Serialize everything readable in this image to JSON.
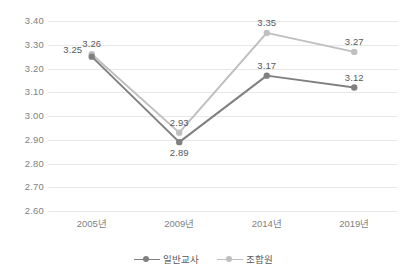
{
  "chart_data": {
    "type": "line",
    "title": "",
    "xlabel": "",
    "ylabel": "",
    "ylim": [
      2.6,
      3.4
    ],
    "ytick_step": 0.1,
    "grid": true,
    "legend_position": "bottom-center",
    "categories": [
      "2005년",
      "2009년",
      "2014년",
      "2019년"
    ],
    "ytick_labels": [
      "3.40",
      "3.30",
      "3.20",
      "3.10",
      "3.00",
      "2.90",
      "2.80",
      "2.70",
      "2.60"
    ],
    "ytick_values": [
      3.4,
      3.3,
      3.2,
      3.1,
      3.0,
      2.9,
      2.8,
      2.7,
      2.6
    ],
    "series": [
      {
        "name": "일반교사",
        "color": "#808080",
        "values": [
          3.25,
          2.89,
          3.17,
          3.12
        ],
        "labels": [
          "3.25",
          "2.89",
          "3.17",
          "3.12"
        ],
        "label_positions": [
          "left",
          "below",
          "above",
          "above"
        ]
      },
      {
        "name": "조합원",
        "color": "#bfbfbf",
        "values": [
          3.26,
          2.93,
          3.35,
          3.27
        ],
        "labels": [
          "3.26",
          "2.93",
          "3.35",
          "3.27"
        ],
        "label_positions": [
          "above",
          "above",
          "above",
          "above"
        ]
      }
    ]
  },
  "legend": {
    "items": [
      {
        "label": "일반교사",
        "color": "#808080"
      },
      {
        "label": "조합원",
        "color": "#bfbfbf"
      }
    ]
  },
  "colors": {
    "background": "#ffffff",
    "gridline": "#e8e8e8",
    "tick_text": "#7f7f7f",
    "label_text": "#595959",
    "series_1": "#808080",
    "series_2": "#bfbfbf"
  }
}
